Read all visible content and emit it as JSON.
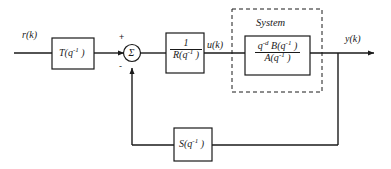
{
  "diagram": {
    "title_label": "System",
    "signals": {
      "reference": "r(k)",
      "control": "u(k)",
      "output": "y(k)"
    },
    "summing_junction": {
      "symbol": "Σ",
      "plus_sign": "+",
      "minus_sign": "-"
    },
    "blocks": {
      "prefilter": {
        "name": "T-block",
        "label": "T(q",
        "label_exp": "-1",
        "label_tail": " )"
      },
      "controller": {
        "name": "one-over-R-block",
        "numerator": "1",
        "denominator": "R(q",
        "denominator_exp": "-1",
        "denominator_tail": " )"
      },
      "plant": {
        "name": "plant-block",
        "numerator_q": "q",
        "numerator_q_exp": "-d",
        "numerator_b": " B(q",
        "numerator_b_exp": "-1",
        "numerator_tail": " )",
        "denominator": "A(q",
        "denominator_exp": "-1",
        "denominator_tail": " )"
      },
      "feedback": {
        "name": "S-block",
        "label": "S(q",
        "label_exp": "-1",
        "label_tail": " )"
      }
    },
    "colors": {
      "line": "#1a1a1a",
      "text": "#1a1a1a",
      "background": "#ffffff"
    }
  }
}
